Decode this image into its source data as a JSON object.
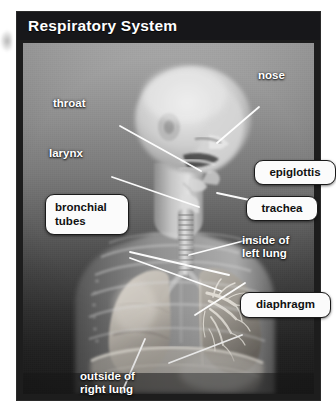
{
  "figure": {
    "title": "Respiratory System",
    "title_bg": "#17171a",
    "title_color": "#ffffff",
    "frame_color": "#1d1d1d",
    "plate_bg": "#6d6d6d"
  },
  "labels": {
    "plain": [
      {
        "name": "label-throat",
        "text": "throat",
        "x": 36,
        "y": 85,
        "w": 70,
        "align": "left"
      },
      {
        "name": "label-larynx",
        "text": "larynx",
        "x": 32,
        "y": 135,
        "w": 70,
        "align": "left"
      },
      {
        "name": "label-nose",
        "text": "nose",
        "x": 241,
        "y": 57,
        "w": 60,
        "align": "left"
      },
      {
        "name": "label-inside-of-left-lung",
        "text": "inside of\nleft lung",
        "x": 225,
        "y": 222,
        "w": 86,
        "align": "left"
      },
      {
        "name": "label-outside-of-right-lung",
        "text": "outside of\nright lung",
        "x": 63,
        "y": 361,
        "w": 100,
        "align": "left"
      }
    ],
    "boxed": [
      {
        "name": "label-box-epiglottis",
        "text": "epiglottis",
        "x": 237,
        "y": 148,
        "w": 80,
        "h": 23
      },
      {
        "name": "label-box-trachea",
        "text": "trachea",
        "x": 229,
        "y": 184,
        "w": 70,
        "h": 23
      },
      {
        "name": "label-box-diaphragm",
        "text": "diaphragm",
        "x": 223,
        "y": 280,
        "w": 89,
        "h": 24
      },
      {
        "name": "label-box-bronchial-tubes",
        "text": "bronchial\ntubes",
        "x": 28,
        "y": 182,
        "w": 84,
        "h": 41
      }
    ]
  },
  "anatomy": {
    "parts": [
      "head",
      "nasal-cavity",
      "mouth",
      "tongue",
      "epiglottis",
      "larynx",
      "trachea",
      "left-lung",
      "right-lung",
      "bronchial-tree",
      "ribcage",
      "diaphragm",
      "shoulders",
      "torso"
    ],
    "leader_lines": [
      {
        "name": "leader-throat",
        "from": [
          103,
          86
        ],
        "to": [
          176,
          130
        ]
      },
      {
        "name": "leader-larynx",
        "from": [
          95,
          137
        ],
        "to": [
          171,
          163
        ]
      },
      {
        "name": "leader-nose",
        "from": [
          238,
          66
        ],
        "to": [
          196,
          99
        ]
      },
      {
        "name": "leader-epiglottis",
        "from": [
          236,
          159
        ],
        "to": [
          196,
          151
        ]
      },
      {
        "name": "leader-trachea",
        "from": [
          228,
          196
        ],
        "to": [
          168,
          212
        ]
      },
      {
        "name": "leader-inside-of-left-lung",
        "from": [
          228,
          238
        ],
        "to": [
          176,
          268
        ]
      },
      {
        "name": "leader-diaphragm",
        "from": [
          222,
          292
        ],
        "to": [
          150,
          318
        ]
      },
      {
        "name": "leader-bronchial-tubes-a",
        "from": [
          113,
          210
        ],
        "to": [
          204,
          231
        ]
      },
      {
        "name": "leader-bronchial-tubes-b",
        "from": [
          113,
          216
        ],
        "to": [
          196,
          246
        ]
      },
      {
        "name": "leader-outside-of-right-lung",
        "from": [
          96,
          358
        ],
        "to": [
          124,
          300
        ]
      }
    ]
  }
}
